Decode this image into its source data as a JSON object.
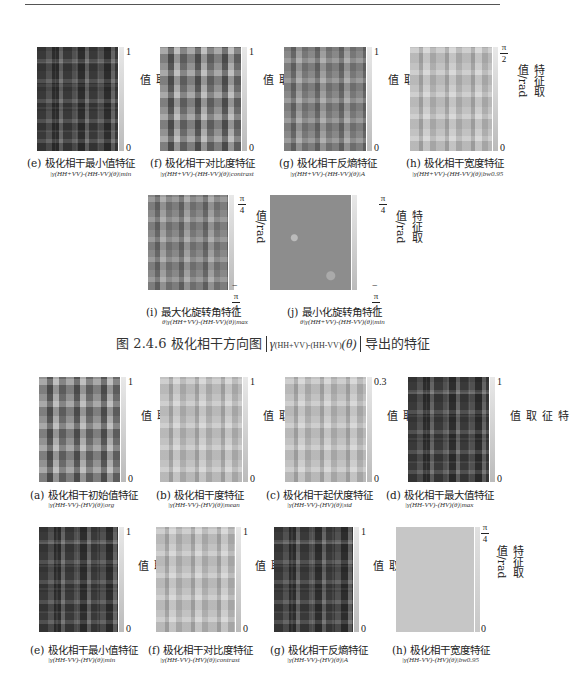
{
  "figure_1": {
    "title_prefix": "图 2.4.6   极化相干方向图",
    "title_symbol": "γ",
    "title_subscript": "(HH+VV)-(HH-VV)",
    "title_arg": "(θ)",
    "title_suffix": "导出的特征",
    "panels": [
      {
        "id": "e",
        "caption": "(e) 极化相干最小值特征",
        "formula": "|γ(HH+VV)-(HH-VV)(θ)|min",
        "tick_top": "1",
        "tick_bottom": "0",
        "axis_label": "特征取值",
        "tone": "dark"
      },
      {
        "id": "f",
        "caption": "(f) 极化相干对比度特征",
        "formula": "|γ(HH+VV)-(HH-VV)(θ)|contrast",
        "tick_top": "1",
        "tick_bottom": "0",
        "axis_label": "特征取值",
        "tone": "mixed"
      },
      {
        "id": "g",
        "caption": "(g) 极化相干反熵特征",
        "formula": "|γ(HH+VV)-(HH-VV)(θ)|A",
        "tick_top": "1",
        "tick_bottom": "0",
        "axis_label": "特征取值",
        "tone": "mid"
      },
      {
        "id": "h",
        "caption": "(h) 极化相干宽度特征",
        "formula": "|γ(HH+VV)-(HH-VV)(θ)|bw0.95",
        "tick_top_num": "π",
        "tick_top_den": "2",
        "tick_bottom": "0",
        "axis_label": "特征取值/rad",
        "tone": "light"
      },
      {
        "id": "i",
        "caption": "(i) 最大化旋转角特征",
        "formula": "θ|γ(HH+VV)-(HH-VV)(θ)|max",
        "tick_top_num": "π",
        "tick_top_den": "4",
        "tick_bottom_sign": "−",
        "tick_bottom_num": "π",
        "tick_bottom_den": "4",
        "axis_label": "特征取值/rad",
        "tone": "mid"
      },
      {
        "id": "j",
        "caption": "(j) 最小化旋转角特征",
        "formula": "θ|γ(HH+VV)-(HH-VV)(θ)|min",
        "tick_top_num": "π",
        "tick_top_den": "4",
        "tick_bottom_sign": "−",
        "tick_bottom_num": "π",
        "tick_bottom_den": "4",
        "axis_label": "特征取值/rad",
        "tone": "flat"
      }
    ]
  },
  "figure_2": {
    "panels": [
      {
        "id": "a",
        "caption": "(a) 极化相干初始值特征",
        "formula": "|γ(HH-VV)-(HV)(θ)|org",
        "tick_top": "1",
        "tick_bottom": "0",
        "axis_label": "特征取值",
        "tone": "mixed"
      },
      {
        "id": "b",
        "caption": "(b) 极化相干度特征",
        "formula": "|γ(HH-VV)-(HV)(θ)|mean",
        "tick_top": "1",
        "tick_bottom": "0",
        "axis_label": "特征取值",
        "tone": "light"
      },
      {
        "id": "c",
        "caption": "(c) 极化相干起伏度特征",
        "formula": "|γ(HH-VV)-(HV)(θ)|std",
        "tick_top": "0.3",
        "tick_bottom": "0",
        "axis_label": "特征取值",
        "tone": "light"
      },
      {
        "id": "d",
        "caption": "(d) 极化相干最大值特征",
        "formula": "|γ(HH-VV)-(HV)(θ)|max",
        "tick_top": "1",
        "tick_bottom": "0",
        "axis_label": "特征取值",
        "tone": "dark"
      },
      {
        "id": "e",
        "caption": "(e) 极化相干最小值特征",
        "formula": "|γ(HH-VV)-(HV)(θ)|min",
        "tick_top": "1",
        "tick_bottom": "0",
        "axis_label": "特征取值",
        "tone": "dark"
      },
      {
        "id": "f",
        "caption": "(f) 极化相干对比度特征",
        "formula": "|γ(HH-VV)-(HV)(θ)|contrast",
        "tick_top": "1",
        "tick_bottom": "0",
        "axis_label": "特征取值",
        "tone": "light"
      },
      {
        "id": "g",
        "caption": "(g) 极化相干反熵特征",
        "formula": "|γ(HH-VV)-(HV)(θ)|A",
        "tick_top": "1",
        "tick_bottom": "0",
        "axis_label": "特征取值",
        "tone": "dark"
      },
      {
        "id": "h",
        "caption": "(h) 极化相干宽度特征",
        "formula": "|γ(HH-VV)-(HV)(θ)|bw0.95",
        "tick_top_num": "π",
        "tick_top_den": "4",
        "tick_bottom": "0",
        "axis_label": "特征取值/rad",
        "tone": "uniform"
      }
    ]
  },
  "colors": {
    "dark": "#4a4a4a",
    "mixed": "#7a7a7a",
    "mid": "#8c8c8c",
    "light": "#bdbdbd",
    "flat": "#8a8a8a",
    "uniform": "#c4c4c4",
    "text": "#222222",
    "rule": "#555555"
  }
}
